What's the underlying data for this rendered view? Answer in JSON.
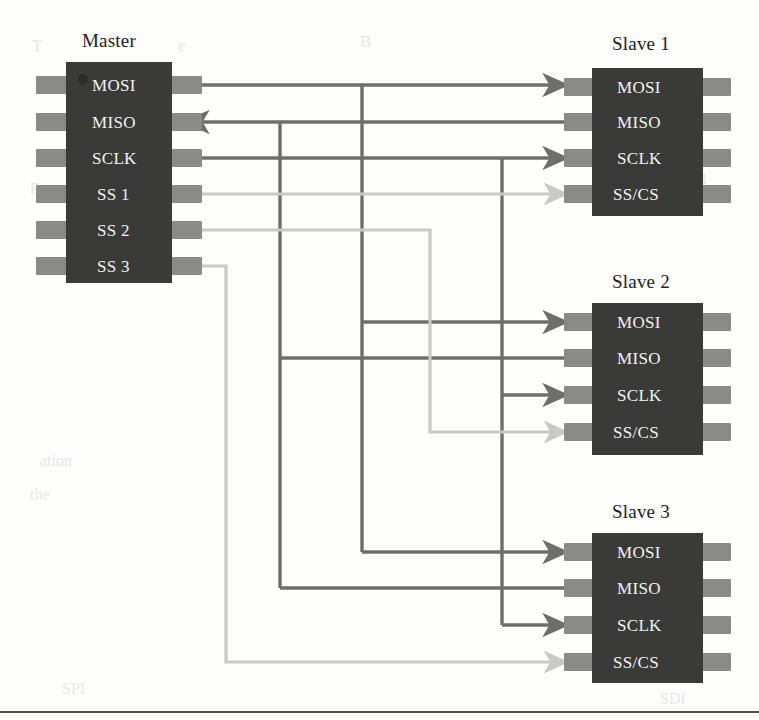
{
  "figure": {
    "kind": "spi-bus-topology-diagram",
    "background_color": "#fdfdfc",
    "chip_body_color": "#3a3a38",
    "chip_pin_color": "#8a8a88",
    "bus_wire_color": "#6e6e6c",
    "select_wire_color": "#c9c9c6",
    "label_color": "#f2f2f0",
    "title_color": "#1d1d1d",
    "rule_color": "#4a4a48"
  },
  "master": {
    "title": "Master",
    "pins": [
      {
        "label": "MOSI"
      },
      {
        "label": "MISO"
      },
      {
        "label": "SCLK"
      },
      {
        "label": "SS 1"
      },
      {
        "label": "SS 2"
      },
      {
        "label": "SS 3"
      }
    ]
  },
  "slaves": [
    {
      "title": "Slave 1",
      "pins": [
        {
          "label": "MOSI"
        },
        {
          "label": "MISO"
        },
        {
          "label": "SCLK"
        },
        {
          "label": "SS/CS"
        }
      ]
    },
    {
      "title": "Slave 2",
      "pins": [
        {
          "label": "MOSI"
        },
        {
          "label": "MISO"
        },
        {
          "label": "SCLK"
        },
        {
          "label": "SS/CS"
        }
      ]
    },
    {
      "title": "Slave 3",
      "pins": [
        {
          "label": "MOSI"
        },
        {
          "label": "MISO"
        },
        {
          "label": "SCLK"
        },
        {
          "label": "SS/CS"
        }
      ]
    }
  ],
  "connections": [
    {
      "name": "mosi-bus",
      "from": "master.MOSI",
      "to": [
        "slave1.MOSI",
        "slave2.MOSI",
        "slave3.MOSI"
      ],
      "style": "bus",
      "direction": "master-to-slave"
    },
    {
      "name": "miso-bus",
      "from": [
        "slave1.MISO",
        "slave2.MISO",
        "slave3.MISO"
      ],
      "to": "master.MISO",
      "style": "bus",
      "direction": "slave-to-master"
    },
    {
      "name": "sclk-bus",
      "from": "master.SCLK",
      "to": [
        "slave1.SCLK",
        "slave2.SCLK",
        "slave3.SCLK"
      ],
      "style": "bus",
      "direction": "master-to-slave"
    },
    {
      "name": "ss1-line",
      "from": "master.SS 1",
      "to": "slave1.SS/CS",
      "style": "select",
      "direction": "master-to-slave"
    },
    {
      "name": "ss2-line",
      "from": "master.SS 2",
      "to": "slave2.SS/CS",
      "style": "select",
      "direction": "master-to-slave"
    },
    {
      "name": "ss3-line",
      "from": "master.SS 3",
      "to": "slave3.SS/CS",
      "style": "select",
      "direction": "master-to-slave"
    }
  ],
  "bleed_through_text": {
    "note": "faint show-through text from the reverse page",
    "items": [
      {
        "text": "T",
        "x": 32,
        "y": 36,
        "size": 17
      },
      {
        "text": "e",
        "x": 178,
        "y": 36,
        "size": 17
      },
      {
        "text": "B",
        "x": 360,
        "y": 32,
        "size": 17
      },
      {
        "text": "1",
        "x": 700,
        "y": 170,
        "size": 16
      },
      {
        "text": "R",
        "x": 30,
        "y": 180,
        "size": 16
      },
      {
        "text": "UART",
        "x": 118,
        "y": 262,
        "size": 16
      },
      {
        "text": "ation",
        "x": 40,
        "y": 452,
        "size": 16
      },
      {
        "text": "the",
        "x": 30,
        "y": 486,
        "size": 16
      },
      {
        "text": "SPI",
        "x": 62,
        "y": 680,
        "size": 16
      },
      {
        "text": "SDI",
        "x": 660,
        "y": 690,
        "size": 16
      }
    ]
  },
  "page_rule": {
    "present": true,
    "y": 712
  }
}
